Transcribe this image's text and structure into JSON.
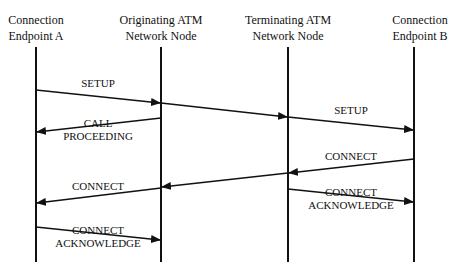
{
  "diagram": {
    "type": "sequence",
    "participants": [
      {
        "id": "A",
        "line1": "Connection",
        "line2": "Endpoint A",
        "x": 36
      },
      {
        "id": "ON",
        "line1": "Originating ATM",
        "line2": "Network Node",
        "x": 161
      },
      {
        "id": "TN",
        "line1": "Terminating ATM",
        "line2": "Network Node",
        "x": 288
      },
      {
        "id": "B",
        "line1": "Connection",
        "line2": "Endpoint B",
        "x": 414
      }
    ],
    "messages": [
      {
        "from": "A",
        "to": "ON",
        "line1": "SETUP",
        "line2": ""
      },
      {
        "from": "ON",
        "to": "TN",
        "line1": "",
        "line2": ""
      },
      {
        "from": "TN",
        "to": "B",
        "line1": "SETUP",
        "line2": ""
      },
      {
        "from": "ON",
        "to": "A",
        "line1": "CALL",
        "line2": "PROCEEDING"
      },
      {
        "from": "B",
        "to": "TN",
        "line1": "CONNECT",
        "line2": ""
      },
      {
        "from": "TN",
        "to": "ON",
        "line1": "",
        "line2": ""
      },
      {
        "from": "ON",
        "to": "A",
        "line1": "CONNECT",
        "line2": ""
      },
      {
        "from": "TN",
        "to": "B",
        "line1": "CONNECT",
        "line2": "ACKNOWLEDGE"
      },
      {
        "from": "A",
        "to": "ON",
        "line1": "CONNECT",
        "line2": "ACKNOWLEDGE"
      }
    ]
  }
}
